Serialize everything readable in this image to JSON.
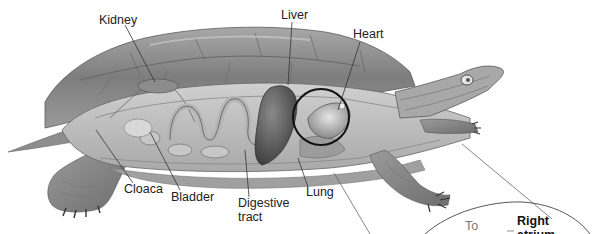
{
  "diagram": {
    "labels": {
      "kidney": "Kidney",
      "liver": "Liver",
      "heart": "Heart",
      "cloaca": "Cloaca",
      "bladder": "Bladder",
      "digestive_line1": "Digestive",
      "digestive_line2": "tract",
      "lung": "Lung"
    },
    "inset": {
      "to_label": "To",
      "right_atrium_line1": "Right",
      "right_atrium_line2": "atrium"
    },
    "colors": {
      "background": "#ffffff",
      "shell": "#8a8a8a",
      "body": "#b5b5b5",
      "organ_dark": "#555555",
      "outline": "#111111",
      "leader": "#333333"
    }
  }
}
